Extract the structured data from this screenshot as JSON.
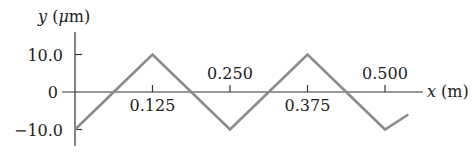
{
  "chart_data": {
    "type": "line",
    "title": "",
    "xlabel": "x (m)",
    "ylabel": "y (μm)",
    "xlim": [
      0,
      0.55
    ],
    "ylim": [
      -10.0,
      10.0
    ],
    "grid": false,
    "legend": null,
    "x_ticks": [
      {
        "value": 0.125,
        "label": "0.125",
        "label_position": "below"
      },
      {
        "value": 0.25,
        "label": "0.250",
        "label_position": "above"
      },
      {
        "value": 0.375,
        "label": "0.375",
        "label_position": "below"
      },
      {
        "value": 0.5,
        "label": "0.500",
        "label_position": "above"
      }
    ],
    "y_ticks": [
      {
        "value": 10.0,
        "label": "10.0"
      },
      {
        "value": 0,
        "label": "0"
      },
      {
        "value": -10.0,
        "label": "−10.0"
      }
    ],
    "series": [
      {
        "name": "triangle wave",
        "color": "#8c8c8c",
        "x": [
          0,
          0.0625,
          0.125,
          0.1875,
          0.25,
          0.3125,
          0.375,
          0.4375,
          0.5,
          0.5375
        ],
        "y": [
          -10.0,
          0,
          10.0,
          0,
          -10.0,
          0,
          10.0,
          0,
          -10.0,
          -6.0
        ]
      }
    ]
  }
}
